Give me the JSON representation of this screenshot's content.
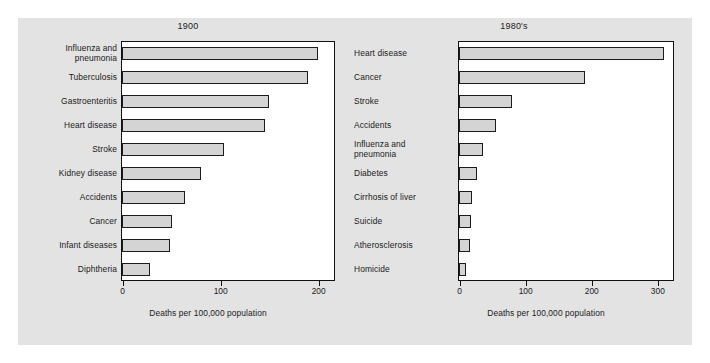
{
  "figure": {
    "background_color": "#e3e3e3",
    "bar_fill_color": "#d4d4d4",
    "bar_edge_color": "#1b1b1b"
  },
  "chart_data": [
    {
      "type": "bar",
      "orientation": "horizontal",
      "title": "1900",
      "xlabel": "Deaths per 100,000 population",
      "ylabel": "",
      "xlim": [
        0,
        215
      ],
      "xticks": [
        0,
        100,
        200
      ],
      "xticklabels": [
        "0",
        "100",
        "200"
      ],
      "grid": false,
      "legend": false,
      "categories": [
        "Influenza and\npneumonia",
        "Tuberculosis",
        "Gastroenteritis",
        "Heart disease",
        "Stroke",
        "Kidney disease",
        "Accidents",
        "Cancer",
        "Infant diseases",
        "Diphtheria"
      ],
      "values": [
        200,
        190,
        150,
        146,
        104,
        81,
        64,
        51,
        49,
        29
      ]
    },
    {
      "type": "bar",
      "orientation": "horizontal",
      "title": "1980's",
      "xlabel": "Deaths per 100,000 population",
      "ylabel": "",
      "xlim": [
        0,
        322
      ],
      "xticks": [
        0,
        100,
        200,
        300
      ],
      "xticklabels": [
        "0",
        "100",
        "200",
        "300"
      ],
      "grid": false,
      "legend": false,
      "categories": [
        "Heart disease",
        "Cancer",
        "Stroke",
        "Accidents",
        "Influenza and\npneumonia",
        "Diabetes",
        "Cirrhosis of liver",
        "Suicide",
        "Atherosclerosis",
        "Homicide"
      ],
      "values": [
        310,
        190,
        80,
        56,
        36,
        27,
        20,
        18,
        16,
        11
      ]
    }
  ]
}
